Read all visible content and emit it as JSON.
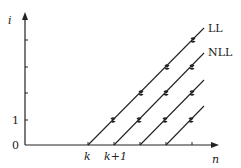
{
  "axes": {
    "y_label": "i",
    "x_label": "n",
    "y_ticks": [
      "0",
      "1"
    ],
    "x_ticks": [
      "k",
      "k+1"
    ]
  },
  "lines": [
    {
      "name": "LL",
      "label": "LL",
      "start_n": 0
    },
    {
      "name": "NLL",
      "label": "NLL",
      "start_n": 1
    },
    {
      "name": "line-3",
      "label": "",
      "start_n": 2
    },
    {
      "name": "line-4",
      "label": "",
      "start_n": 3
    }
  ],
  "colors": {
    "stroke": "#222222"
  }
}
